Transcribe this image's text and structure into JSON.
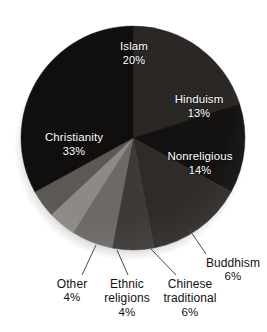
{
  "chart_data": {
    "type": "pie",
    "title": "",
    "subtitle": "",
    "xlabel": "",
    "ylabel": "",
    "legend_position": "none",
    "grid": false,
    "units": "percent",
    "start_angle_deg": 0,
    "direction": "clockwise",
    "categories": [
      "Islam",
      "Hinduism",
      "Nonreligious",
      "Buddhism",
      "Chinese traditional",
      "Ethnic religions",
      "Other",
      "Christianity"
    ],
    "values": [
      20,
      13,
      14,
      6,
      6,
      4,
      4,
      33
    ],
    "slices": [
      {
        "label": "Islam",
        "label_line1": "Islam",
        "label_line2": "",
        "value": 20,
        "pct_text": "20%",
        "color": "#2a2725",
        "label_placement": "inside",
        "label_color": "#ffffff"
      },
      {
        "label": "Hinduism",
        "label_line1": "Hinduism",
        "label_line2": "",
        "value": 13,
        "pct_text": "13%",
        "color": "#131211",
        "label_placement": "inside",
        "label_color": "#ffffff"
      },
      {
        "label": "Nonreligious",
        "label_line1": "Nonreligious",
        "label_line2": "",
        "value": 14,
        "pct_text": "14%",
        "color": "#2e2b29",
        "label_placement": "inside",
        "label_color": "#ffffff"
      },
      {
        "label": "Buddhism",
        "label_line1": "Buddhism",
        "label_line2": "",
        "value": 6,
        "pct_text": "6%",
        "color": "#3d3a37",
        "label_placement": "outside",
        "label_color": "#111111"
      },
      {
        "label": "Chinese traditional",
        "label_line1": "Chinese",
        "label_line2": "traditional",
        "value": 6,
        "pct_text": "6%",
        "color": "#6d6a66",
        "label_placement": "outside",
        "label_color": "#111111"
      },
      {
        "label": "Ethnic religions",
        "label_line1": "Ethnic",
        "label_line2": "religions",
        "value": 4,
        "pct_text": "4%",
        "color": "#8d8a85",
        "label_placement": "outside",
        "label_color": "#111111"
      },
      {
        "label": "Other",
        "label_line1": "Other",
        "label_line2": "",
        "value": 4,
        "pct_text": "4%",
        "color": "#5c5955",
        "label_placement": "outside",
        "label_color": "#111111"
      },
      {
        "label": "Christianity",
        "label_line1": "Christianity",
        "label_line2": "",
        "value": 33,
        "pct_text": "33%",
        "color": "#100f0e",
        "label_placement": "inside",
        "label_color": "#ffffff"
      }
    ],
    "background_color": "#ffffff",
    "leader_line_color": "#4a4a4a"
  }
}
